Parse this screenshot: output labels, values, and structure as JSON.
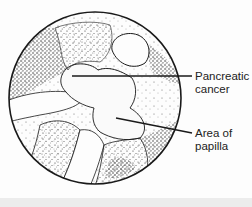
{
  "figure": {
    "type": "endoscopic-view-illustration",
    "labels": [
      {
        "id": "pancreatic-cancer",
        "lines": [
          "Pancreatic",
          "cancer"
        ]
      },
      {
        "id": "area-of-papilla",
        "lines": [
          "Area of",
          "papilla"
        ]
      }
    ]
  },
  "colors": {
    "ink": "#1a1a1a",
    "background": "#fdfdfd",
    "footer": "#ececec"
  }
}
